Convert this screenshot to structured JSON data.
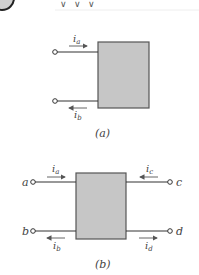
{
  "header": {
    "badge_icon": "circle-badge",
    "marks": [
      "∨",
      "∨",
      "∨"
    ]
  },
  "figure_a": {
    "caption": "(a)",
    "currents": {
      "top": "i",
      "top_sub": "a",
      "bottom": "i",
      "bottom_sub": "b"
    }
  },
  "figure_b": {
    "caption": "(b)",
    "terminals": {
      "left_top": "a",
      "left_bottom": "b",
      "right_top": "c",
      "right_bottom": "d"
    },
    "currents": {
      "a": "i",
      "a_sub": "a",
      "b": "i",
      "b_sub": "b",
      "c": "i",
      "c_sub": "c",
      "d": "i",
      "d_sub": "d"
    }
  },
  "colors": {
    "box_fill": "#c6c6c6",
    "box_stroke": "#555555",
    "wire": "#333333",
    "arrow": "#555555"
  }
}
